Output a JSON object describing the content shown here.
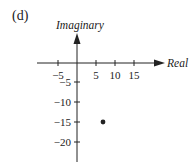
{
  "panel_label": "(d)",
  "diagram": {
    "type": "argand-plane",
    "x_axis_label": "Real",
    "y_axis_label": "Imaginary",
    "x_ticks": [
      {
        "value": -5,
        "label": "−5"
      },
      {
        "value": 5,
        "label": "5"
      },
      {
        "value": 10,
        "label": "10"
      },
      {
        "value": 15,
        "label": "15"
      }
    ],
    "y_ticks": [
      {
        "value": -5,
        "label": "−5"
      },
      {
        "value": -10,
        "label": "−10"
      },
      {
        "value": -15,
        "label": "−15"
      },
      {
        "value": -20,
        "label": "−20"
      }
    ],
    "points": [
      {
        "x": 7,
        "y": -15
      }
    ],
    "colors": {
      "ink": "#222222"
    }
  }
}
